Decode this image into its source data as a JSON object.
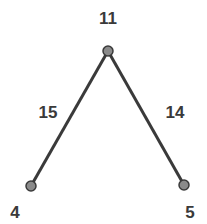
{
  "diagram": {
    "type": "tree",
    "colors": {
      "edge": "#3a3a3a",
      "node_fill": "#8a8a8a",
      "node_stroke": "#3a3a3a",
      "label": "#3a3a3a"
    },
    "nodes": [
      {
        "id": "top",
        "label": "11",
        "x": 108,
        "y": 51,
        "label_x": 108,
        "label_y": 24
      },
      {
        "id": "left",
        "label": "4",
        "x": 31,
        "y": 186,
        "label_x": 15,
        "label_y": 218
      },
      {
        "id": "right",
        "label": "5",
        "x": 184,
        "y": 185,
        "label_x": 190,
        "label_y": 218
      }
    ],
    "edges": [
      {
        "from": "top",
        "to": "left",
        "label": "15",
        "label_x": 48,
        "label_y": 118
      },
      {
        "from": "top",
        "to": "right",
        "label": "14",
        "label_x": 175,
        "label_y": 118
      }
    ]
  }
}
